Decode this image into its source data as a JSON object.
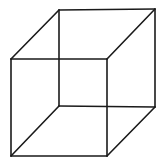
{
  "diagram": {
    "type": "necker-cube-wireframe",
    "stroke_color": "#1a1a1a",
    "background_color": "#ffffff",
    "vertices": {
      "front_top_left": [
        11,
        59
      ],
      "front_top_right": [
        107,
        59
      ],
      "front_bottom_left": [
        11,
        156
      ],
      "front_bottom_right": [
        107,
        156
      ],
      "back_top_left": [
        59,
        10
      ],
      "back_top_right": [
        155,
        9
      ],
      "back_bottom_left": [
        59,
        106
      ],
      "back_bottom_right": [
        155,
        107
      ]
    },
    "edges": [
      [
        "front_top_left",
        "front_top_right"
      ],
      [
        "front_top_right",
        "front_bottom_right"
      ],
      [
        "front_bottom_right",
        "front_bottom_left"
      ],
      [
        "front_bottom_left",
        "front_top_left"
      ],
      [
        "back_top_left",
        "back_top_right"
      ],
      [
        "back_top_right",
        "back_bottom_right"
      ],
      [
        "back_bottom_right",
        "back_bottom_left"
      ],
      [
        "back_bottom_left",
        "back_top_left"
      ],
      [
        "front_top_left",
        "back_top_left"
      ],
      [
        "front_top_right",
        "back_top_right"
      ],
      [
        "front_bottom_left",
        "back_bottom_left"
      ],
      [
        "front_bottom_right",
        "back_bottom_right"
      ]
    ]
  }
}
